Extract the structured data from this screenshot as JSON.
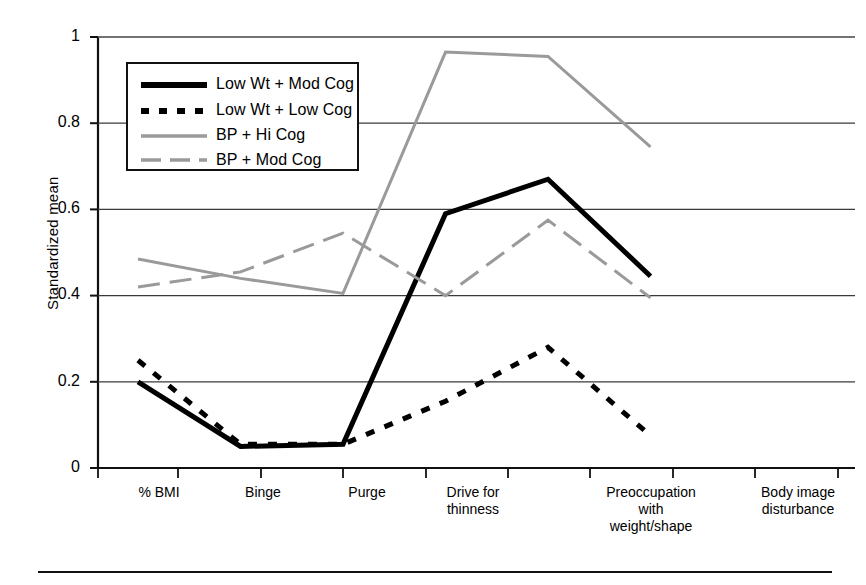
{
  "figure": {
    "y_axis_title": "Standardized mean",
    "y_ticks": [
      "1",
      "0.8",
      "0.6",
      "0.4",
      "0.2",
      "0"
    ],
    "x_ticks": [
      "% BMI",
      "Binge",
      "Purge",
      "Drive for\nthinness",
      "Preoccupation\nwith\nweight/shape",
      "Body image\ndisturbance"
    ],
    "legend": {
      "items": [
        {
          "label": "Low Wt + Mod Cog",
          "style": "solid-thick-black",
          "color": "#000000"
        },
        {
          "label": "Low Wt + Low Cog",
          "style": "dashed-thick-black",
          "color": "#000000"
        },
        {
          "label": "BP + Hi Cog",
          "style": "solid-thin-gray",
          "color": "#9a9a9a"
        },
        {
          "label": "BP + Mod Cog",
          "style": "dashed-thin-gray",
          "color": "#9a9a9a"
        }
      ]
    }
  },
  "chart_data": {
    "type": "line",
    "title": "",
    "xlabel": "",
    "ylabel": "Standardized mean",
    "ylim": [
      0,
      1
    ],
    "ytick_values": [
      1,
      0.8,
      0.6,
      0.4,
      0.2,
      0
    ],
    "grid": "horizontal",
    "legend_position": "upper-left-inside",
    "categories": [
      "% BMI",
      "Binge",
      "Purge",
      "Drive for thinness",
      "Preoccupation with weight/shape",
      "Body image disturbance"
    ],
    "series": [
      {
        "name": "Low Wt + Mod Cog",
        "color": "#000000",
        "line_style": "solid",
        "line_width": 5,
        "values": [
          0.2,
          0.05,
          0.055,
          0.59,
          0.67,
          0.445
        ]
      },
      {
        "name": "Low Wt + Low Cog",
        "color": "#000000",
        "line_style": "dashed",
        "line_width": 5,
        "values": [
          0.25,
          0.055,
          0.055,
          0.155,
          0.28,
          0.075
        ]
      },
      {
        "name": "BP + Hi Cog",
        "color": "#9a9a9a",
        "line_style": "solid",
        "line_width": 3,
        "values": [
          0.485,
          0.44,
          0.405,
          0.965,
          0.955,
          0.745
        ]
      },
      {
        "name": "BP + Mod Cog",
        "color": "#9a9a9a",
        "line_style": "dashed",
        "line_width": 3,
        "values": [
          0.42,
          0.455,
          0.545,
          0.4,
          0.575,
          0.395
        ]
      }
    ]
  }
}
